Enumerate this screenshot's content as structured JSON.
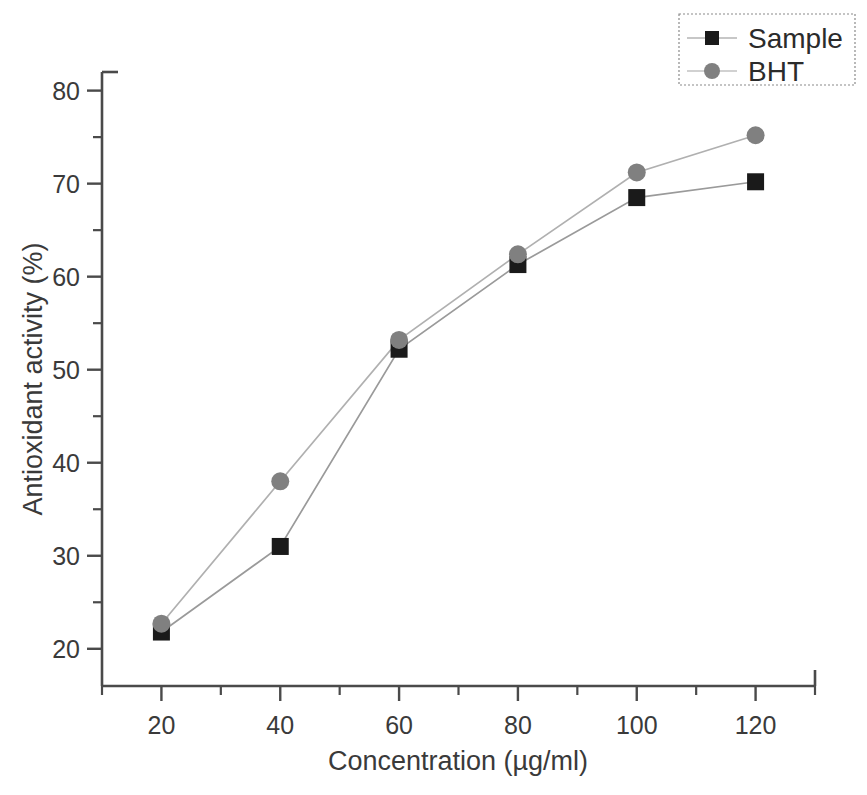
{
  "chart_data": {
    "type": "line",
    "title": "",
    "xlabel": "Concentration (µg/ml)",
    "ylabel": "Antioxidant activity (%)",
    "x": [
      20,
      40,
      60,
      80,
      100,
      120
    ],
    "xlim": [
      10,
      130
    ],
    "ylim": [
      16,
      82
    ],
    "xticks": [
      20,
      40,
      60,
      80,
      100,
      120
    ],
    "xtick_labels": [
      "20",
      "40",
      "60",
      "80",
      "100",
      "120"
    ],
    "xminorticks": [
      10,
      30,
      50,
      70,
      90,
      110,
      130
    ],
    "yticks": [
      20,
      30,
      40,
      50,
      60,
      70,
      80
    ],
    "ytick_labels": [
      "20",
      "30",
      "40",
      "50",
      "60",
      "70",
      "80"
    ],
    "yminorticks": [
      25,
      35,
      45,
      55,
      65,
      75
    ],
    "grid": false,
    "legend_position": "top-right",
    "series": [
      {
        "name": "Sample",
        "marker": "square",
        "color": "#1a1a1a",
        "line_color": "#9a9a9a",
        "values": [
          21.8,
          31.0,
          52.2,
          61.3,
          68.5,
          70.2
        ]
      },
      {
        "name": "BHT",
        "marker": "circle",
        "color": "#808080",
        "line_color": "#b0b0b0",
        "values": [
          22.7,
          38.0,
          53.2,
          62.4,
          71.2,
          75.2
        ]
      }
    ]
  },
  "legend": {
    "items": [
      {
        "label": "Sample"
      },
      {
        "label": "BHT"
      }
    ]
  },
  "axes": {
    "x_title": "Concentration (µg/ml)",
    "y_title": "Antioxidant activity (%)"
  },
  "colors": {
    "sample_marker": "#1a1a1a",
    "bht_marker": "#808080",
    "axis": "#4a4a4a",
    "background": "#ffffff"
  }
}
